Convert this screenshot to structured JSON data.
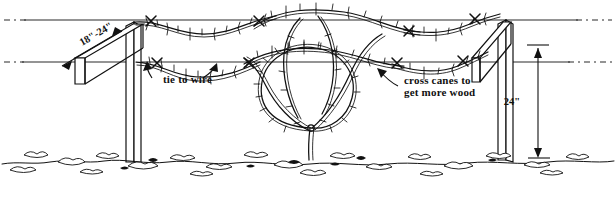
{
  "diagram": {
    "background_color": "#ffffff",
    "ink_color": "#111111",
    "wire_color": "#2b2b2b",
    "canvas": {
      "width": 616,
      "height": 199
    }
  },
  "labels": {
    "arm_span": {
      "text": "18\"-24\"",
      "name": "cross-arm-span-dimension",
      "rotation_deg": -22,
      "x": 82,
      "y": 46
    },
    "tie_to_wire": {
      "text": "tie to wire",
      "name": "tie-to-wire-callout",
      "x": 163,
      "y": 82
    },
    "cross_canes_line1": {
      "text": "cross canes to",
      "name": "cross-canes-callout-line-1",
      "x": 404,
      "y": 83
    },
    "cross_canes_line2": {
      "text": "get more wood",
      "name": "cross-canes-callout-line-2",
      "x": 404,
      "y": 95
    },
    "post_height": {
      "text": "24\"",
      "name": "post-height-dimension",
      "x": 512,
      "y": 105
    }
  },
  "wires": [
    {
      "name": "upper-trellis-wire",
      "y": 20,
      "x_start": 8,
      "x_end": 608
    },
    {
      "name": "lower-trellis-wire",
      "y": 62,
      "x_start": 8,
      "x_end": 608
    }
  ],
  "posts": [
    {
      "name": "left-trellis-post",
      "x": 132,
      "top_y": 22,
      "ground_y": 162
    },
    {
      "name": "right-trellis-post",
      "x": 503,
      "top_y": 20,
      "ground_y": 160
    }
  ],
  "plant": {
    "name": "grapevine-plant",
    "trunk_x": 310,
    "ground_y": 160,
    "loop_center_x": 307,
    "loop_center_y": 95,
    "loop_radius": 48
  },
  "ground_line": {
    "name": "soil-surface-line",
    "y": 160
  }
}
